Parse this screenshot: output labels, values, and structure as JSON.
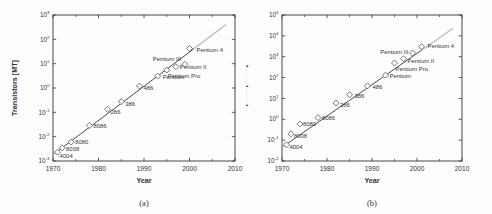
{
  "page": {
    "background": "#fdfdfd"
  },
  "chart_data": [
    {
      "id": "a",
      "type": "scatter",
      "caption": "(a)",
      "xlabel": "Year",
      "ylabel": "Transistors [MT]",
      "xlim": [
        1970,
        2010
      ],
      "x_ticks": [
        1970,
        1980,
        1990,
        2000,
        2010
      ],
      "x_minor_ticks": [
        1975,
        1985,
        1995,
        2005
      ],
      "yscale": "log",
      "ylim": [
        0.001,
        1000
      ],
      "y_tick_exponents": [
        3,
        2,
        1,
        0,
        -1,
        -2,
        -3
      ],
      "grid": false,
      "legend": "none",
      "marker": "open-diamond",
      "colors": {
        "axis": "#333333",
        "marker_stroke": "#666666",
        "marker_fill": "#ffffff",
        "trend": "#4a4a4a",
        "trend_extension": "#c2c2c2",
        "point_label": "#333333"
      },
      "points": [
        {
          "label": "4004",
          "x": 1971,
          "y": 0.0023,
          "dx": 2,
          "dy": 6,
          "anchor": "start"
        },
        {
          "label": "8008",
          "x": 1972,
          "y": 0.0035,
          "dx": 4,
          "dy": 3,
          "anchor": "start"
        },
        {
          "label": "8080",
          "x": 1974,
          "y": 0.006,
          "dx": 4,
          "dy": 2,
          "anchor": "start"
        },
        {
          "label": "8086",
          "x": 1978,
          "y": 0.029,
          "dx": 4,
          "dy": 3,
          "anchor": "start"
        },
        {
          "label": "286",
          "x": 1982,
          "y": 0.134,
          "dx": 3,
          "dy": 5,
          "anchor": "start"
        },
        {
          "label": "386",
          "x": 1985,
          "y": 0.275,
          "dx": 4,
          "dy": 4,
          "anchor": "start"
        },
        {
          "label": "486",
          "x": 1989,
          "y": 1.2,
          "dx": 4,
          "dy": 4,
          "anchor": "start"
        },
        {
          "label": "Pentium",
          "x": 1993,
          "y": 3.1,
          "dx": 5,
          "dy": 3,
          "anchor": "start"
        },
        {
          "label": "Pentium Pro",
          "x": 1995,
          "y": 5.5,
          "dx": 1,
          "dy": 8,
          "anchor": "start"
        },
        {
          "label": "Pentium II",
          "x": 1997,
          "y": 7.5,
          "dx": 4,
          "dy": 2,
          "anchor": "start"
        },
        {
          "label": "Pentium III",
          "x": 1999,
          "y": 9.5,
          "dx": -4,
          "dy": -3,
          "anchor": "end"
        },
        {
          "label": "Pentium 4",
          "x": 2000,
          "y": 42,
          "dx": 7,
          "dy": 3,
          "anchor": "start"
        }
      ],
      "trend": {
        "x1": 1970.3,
        "y1": 0.002,
        "x2": 2008,
        "y2": 400,
        "dark_until": 2001
      }
    },
    {
      "id": "b",
      "type": "scatter",
      "caption": "(b)",
      "xlabel": "Year",
      "ylabel": "Speed [MIPS]",
      "xlim": [
        1970,
        2010
      ],
      "x_ticks": [
        1970,
        1980,
        1990,
        2000,
        2010
      ],
      "x_minor_ticks": [
        1975,
        1985,
        1995,
        2005
      ],
      "yscale": "log",
      "ylim": [
        0.01,
        100000
      ],
      "y_tick_exponents": [
        5,
        4,
        3,
        2,
        1,
        0,
        -1,
        -2
      ],
      "grid": false,
      "legend": "none",
      "marker": "open-diamond",
      "colors": {
        "axis": "#333333",
        "marker_stroke": "#666666",
        "marker_fill": "#ffffff",
        "trend": "#4a4a4a",
        "trend_extension": "#c2c2c2",
        "point_label": "#333333"
      },
      "points": [
        {
          "label": "4004",
          "x": 1971,
          "y": 0.06,
          "dx": 3,
          "dy": 4,
          "anchor": "start"
        },
        {
          "label": "8008",
          "x": 1972,
          "y": 0.2,
          "dx": 3,
          "dy": 4,
          "anchor": "start"
        },
        {
          "label": "8080",
          "x": 1974,
          "y": 0.6,
          "dx": 3,
          "dy": 2,
          "anchor": "start"
        },
        {
          "label": "8086",
          "x": 1978,
          "y": 1.2,
          "dx": 4,
          "dy": 2,
          "anchor": "start"
        },
        {
          "label": "286",
          "x": 1982,
          "y": 6,
          "dx": 4,
          "dy": 4,
          "anchor": "start"
        },
        {
          "label": "386",
          "x": 1985,
          "y": 15,
          "dx": 5,
          "dy": 3,
          "anchor": "start"
        },
        {
          "label": "486",
          "x": 1989,
          "y": 40,
          "dx": 5,
          "dy": 3,
          "anchor": "start"
        },
        {
          "label": "Pentium",
          "x": 1993,
          "y": 130,
          "dx": 4,
          "dy": 3,
          "anchor": "start"
        },
        {
          "label": "Pentium Pro",
          "x": 1995,
          "y": 500,
          "dx": 1,
          "dy": 8,
          "anchor": "start"
        },
        {
          "label": "Pentium II",
          "x": 1997,
          "y": 800,
          "dx": 4,
          "dy": 4,
          "anchor": "start"
        },
        {
          "label": "Pentium III",
          "x": 1999,
          "y": 1500,
          "dx": -4,
          "dy": 1,
          "anchor": "end"
        },
        {
          "label": "Pentium 4",
          "x": 2001,
          "y": 3000,
          "dx": 6,
          "dy": 1,
          "anchor": "start"
        }
      ],
      "trend": {
        "x1": 1970.3,
        "y1": 0.05,
        "x2": 2008,
        "y2": 23000,
        "dark_until": 2001
      }
    }
  ]
}
